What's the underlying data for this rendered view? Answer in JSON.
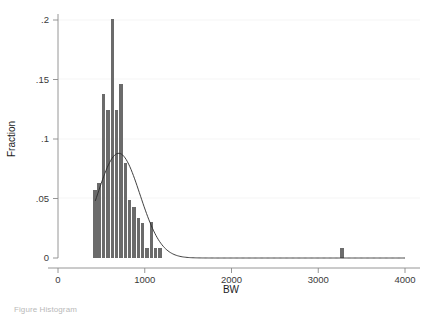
{
  "figure": {
    "background_color": "#ffffff",
    "bar_color": "#6b6b6b",
    "curve_color": "#2b2b2b",
    "axis_color": "#8a8a8a",
    "grid_color": "#f2f2f2"
  },
  "caption": {
    "visible_fragment": "Figure  Histogram",
    "note": "bottom caption line is cropped"
  },
  "chart_data": {
    "type": "bar",
    "title": "",
    "subtitle": "",
    "xlabel": "BW",
    "ylabel": "Fraction",
    "xlim": [
      0,
      4000
    ],
    "ylim": [
      0,
      0.2
    ],
    "xticks": [
      0,
      1000,
      2000,
      3000,
      4000
    ],
    "xtick_labels": [
      "0",
      "1000",
      "2000",
      "3000",
      "4000"
    ],
    "yticks": [
      0,
      0.05,
      0.1,
      0.15,
      0.2
    ],
    "ytick_labels": [
      "0",
      ".05",
      ".1",
      ".15",
      ".2"
    ],
    "grid": "horizontal",
    "legend": "none",
    "bin_width": 50,
    "bar_fill": "#6b6b6b",
    "categories": [
      425,
      475,
      525,
      575,
      625,
      675,
      725,
      775,
      825,
      875,
      925,
      975,
      1025,
      1075,
      1125,
      1175,
      3275
    ],
    "values": [
      0.057,
      0.063,
      0.138,
      0.124,
      0.201,
      0.124,
      0.146,
      0.08,
      0.049,
      0.043,
      0.034,
      0.029,
      0.008,
      0.03,
      0.008,
      0.008,
      0.008
    ],
    "bars": [
      {
        "x": 425,
        "height": 0.057
      },
      {
        "x": 475,
        "height": 0.063
      },
      {
        "x": 525,
        "height": 0.138
      },
      {
        "x": 575,
        "height": 0.124
      },
      {
        "x": 625,
        "height": 0.201
      },
      {
        "x": 675,
        "height": 0.124
      },
      {
        "x": 725,
        "height": 0.146
      },
      {
        "x": 775,
        "height": 0.08
      },
      {
        "x": 825,
        "height": 0.049
      },
      {
        "x": 875,
        "height": 0.043
      },
      {
        "x": 925,
        "height": 0.034
      },
      {
        "x": 975,
        "height": 0.029
      },
      {
        "x": 1025,
        "height": 0.008
      },
      {
        "x": 1075,
        "height": 0.03
      },
      {
        "x": 1125,
        "height": 0.008
      },
      {
        "x": 1175,
        "height": 0.008
      },
      {
        "x": 3275,
        "height": 0.008
      }
    ],
    "overlay": {
      "type": "line",
      "name": "normal density",
      "peak_x": 700,
      "peak_y": 0.088,
      "mean": 700,
      "sigma": 245,
      "x_start": 430,
      "x_end": 4000
    }
  }
}
